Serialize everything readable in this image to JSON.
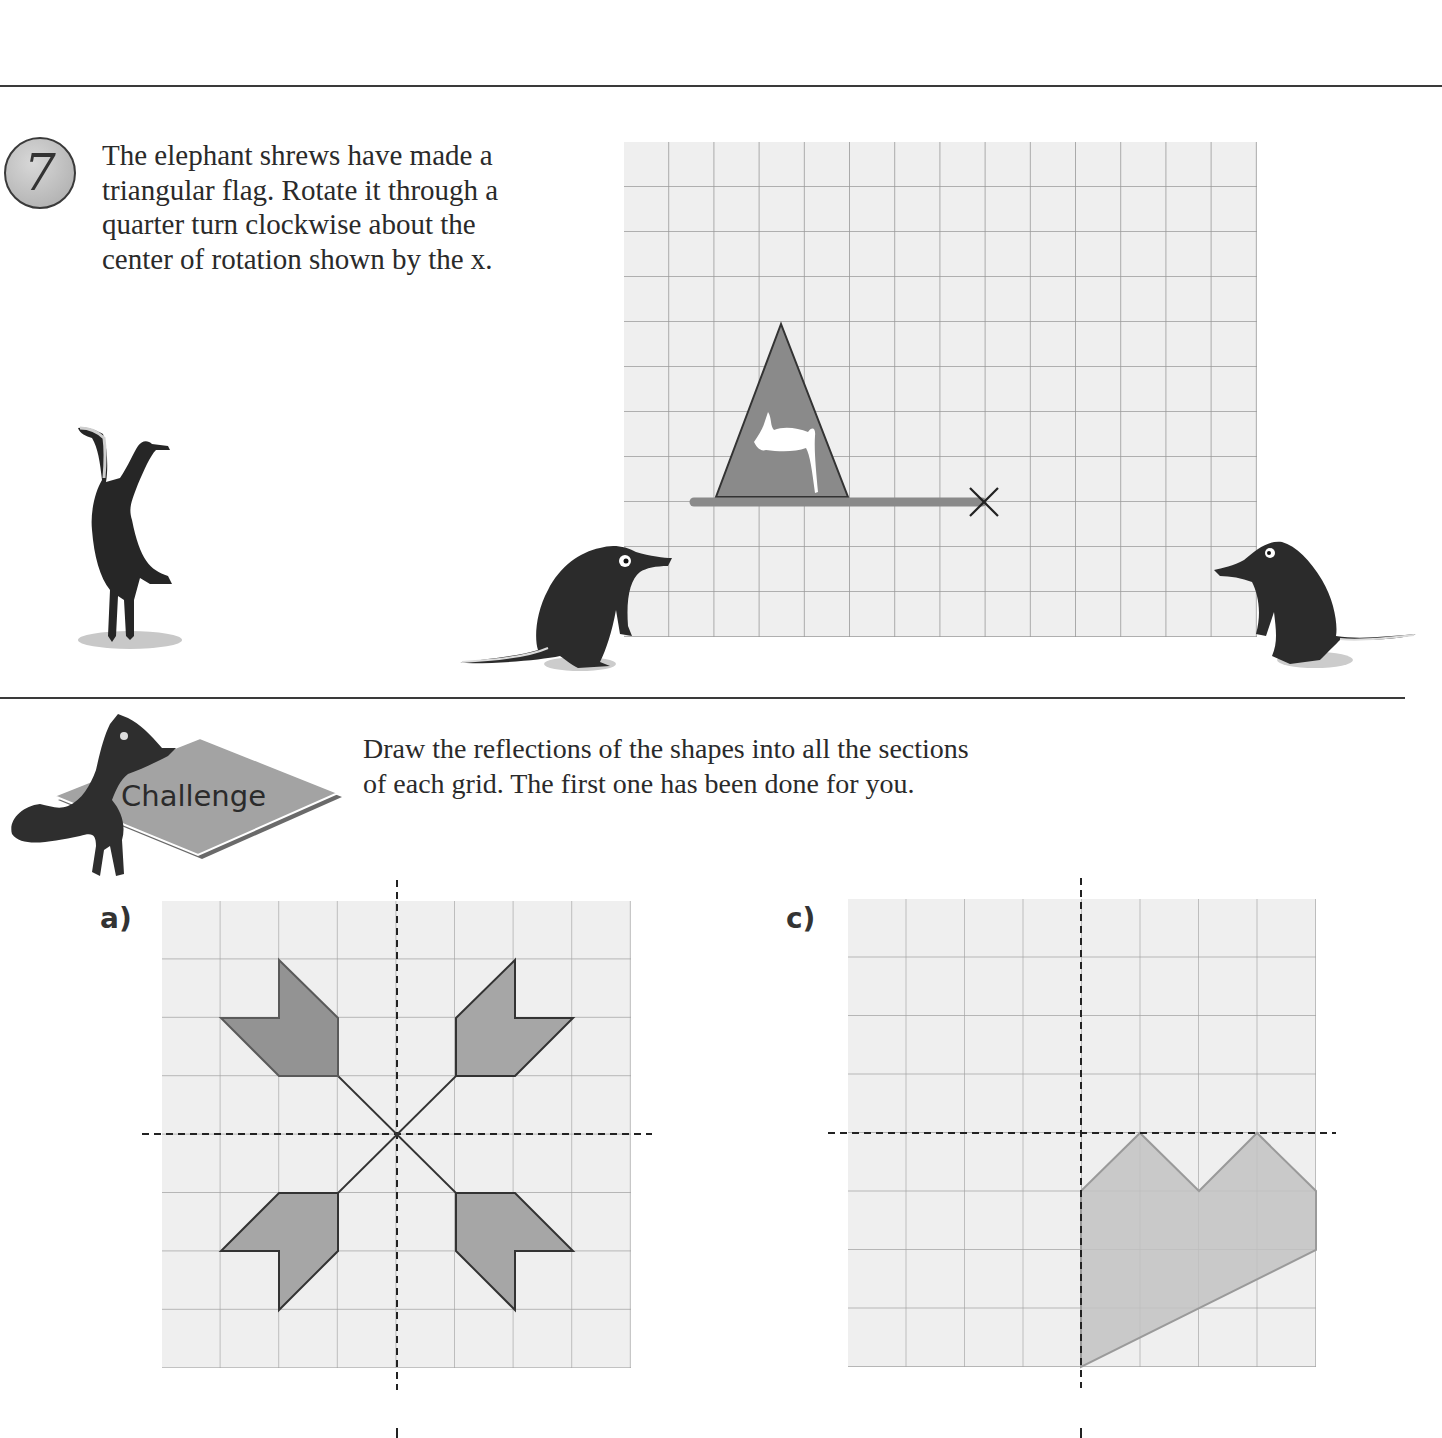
{
  "page": {
    "question": {
      "number": "7",
      "lines": [
        "The elephant shrews have made a",
        "triangular flag. Rotate it through a",
        "quarter turn clockwise about the",
        "center of rotation shown by the x."
      ],
      "grid": {
        "columns": 14,
        "rows": 11,
        "flag": {
          "shape": "triangle",
          "apex_cell": [
            3.5,
            4
          ],
          "base_left_cell": [
            2,
            7.85
          ],
          "base_right_cell": [
            5,
            7.85
          ],
          "pole_from_cell": [
            1.5,
            8
          ],
          "pole_to_cell": [
            8,
            8
          ]
        },
        "center_of_rotation_marker": "x",
        "center_of_rotation_cell": [
          8,
          8
        ]
      }
    },
    "challenge": {
      "badge_label": "Challenge",
      "lines": [
        "Draw the reflections of the shapes into all the sections",
        "of each grid. The first one has been done for you."
      ],
      "grids": [
        {
          "label": "a)",
          "columns": 8,
          "rows": 8,
          "mirror_lines": [
            "vertical-center",
            "horizontal-center"
          ],
          "completed": true
        },
        {
          "label": "c)",
          "columns": 8,
          "rows": 8,
          "mirror_lines": [
            "vertical-center",
            "horizontal-center"
          ],
          "completed": false
        }
      ]
    },
    "colors": {
      "grid_bg": "#efefef",
      "grid_line": "#9a9a9a",
      "shape_fill_dark": "#8c8c8c",
      "shape_fill_light": "#c4c4c4",
      "text": "#2a2a2a"
    }
  }
}
